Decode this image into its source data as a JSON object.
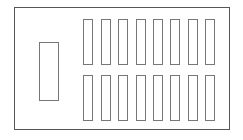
{
  "diagram": {
    "outer_frame": {
      "x": 14,
      "y": 7,
      "w": 216,
      "h": 123,
      "stroke": "#555555"
    },
    "side_block": {
      "x": 39,
      "y": 42,
      "w": 20,
      "h": 59,
      "stroke": "#777777"
    },
    "bars": {
      "rows": [
        {
          "y": 19,
          "h": 46
        },
        {
          "y": 75,
          "h": 46
        }
      ],
      "columns_x": [
        83,
        101,
        118,
        136,
        153,
        170,
        188,
        205
      ],
      "width": 10,
      "stroke": "#777777"
    }
  }
}
